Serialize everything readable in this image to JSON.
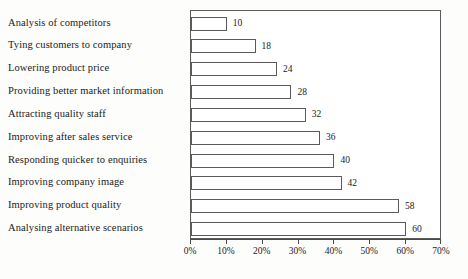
{
  "chart_data": {
    "type": "bar",
    "orientation": "horizontal",
    "title": "",
    "subtitle": "",
    "xlabel": "",
    "ylabel": "",
    "categories": [
      "Analysis of competitors",
      "Tying customers to company",
      "Lowering product price",
      "Providing better market information",
      "Attracting quality staff",
      "Improving after sales service",
      "Responding quicker to enquiries",
      "Improving company image",
      "Improving product quality",
      "Analysing alternative scenarios"
    ],
    "values": [
      10,
      18,
      24,
      28,
      32,
      36,
      40,
      42,
      58,
      60
    ],
    "data_labels": [
      "10",
      "18",
      "24",
      "28",
      "32",
      "36",
      "40",
      "42",
      "58",
      "60"
    ],
    "value_unit": "%",
    "xlim": [
      0,
      70
    ],
    "xticks": [
      0,
      10,
      20,
      30,
      40,
      50,
      60,
      70
    ],
    "xtick_labels": [
      "0%",
      "10%",
      "20%",
      "30%",
      "40%",
      "50%",
      "60%",
      "70%"
    ],
    "grid": false,
    "legend": null,
    "legend_position": "none",
    "bar_fill_color": "#ffffff",
    "bar_border_color": "#5a5a5a",
    "plot_border_color": "#5c5c5c",
    "axis_color": "#4a4a4a",
    "text_color": "#1b1b1b",
    "background_color": "#fdfdfc"
  }
}
